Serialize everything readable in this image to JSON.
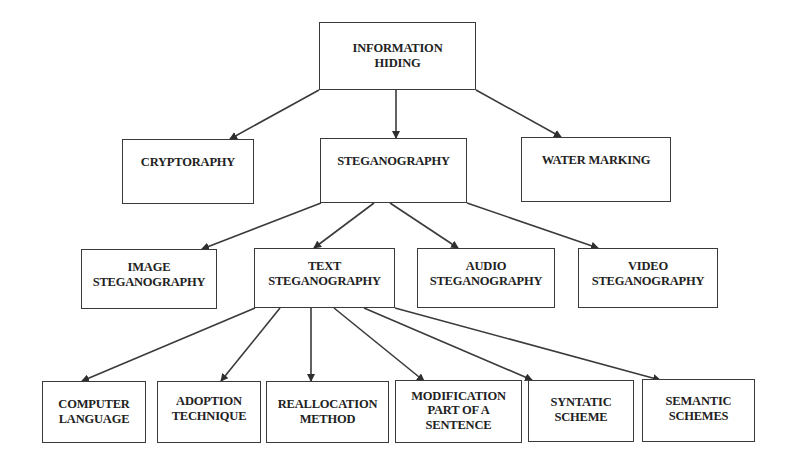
{
  "diagram": {
    "type": "hierarchy",
    "root": {
      "id": "information-hiding",
      "lines": [
        "INFORMATION",
        "HIDING"
      ]
    },
    "level1": [
      {
        "id": "cryptography",
        "lines": [
          "CRYPTORAPHY"
        ]
      },
      {
        "id": "steganography",
        "lines": [
          "STEGANOGRAPHY"
        ]
      },
      {
        "id": "water-marking",
        "lines": [
          "WATER MARKING"
        ]
      }
    ],
    "level2": [
      {
        "id": "image-steganography",
        "lines": [
          "IMAGE",
          "STEGANOGRAPHY"
        ]
      },
      {
        "id": "text-steganography",
        "lines": [
          "TEXT",
          "STEGANOGRAPHY"
        ]
      },
      {
        "id": "audio-steganography",
        "lines": [
          "AUDIO",
          "STEGANOGRAPHY"
        ]
      },
      {
        "id": "video-steganography",
        "lines": [
          "VIDEO",
          "STEGANOGRAPHY"
        ]
      }
    ],
    "level3": [
      {
        "id": "computer-language",
        "lines": [
          "COMPUTER",
          "LANGUAGE"
        ]
      },
      {
        "id": "adoption-technique",
        "lines": [
          "ADOPTION",
          "TECHNIQUE"
        ]
      },
      {
        "id": "reallocation-method",
        "lines": [
          "REALLOCATION",
          "METHOD"
        ]
      },
      {
        "id": "modification-part-of-a-sentence",
        "lines": [
          "MODIFICATION",
          "PART OF A",
          "SENTENCE"
        ]
      },
      {
        "id": "syntatic-scheme",
        "lines": [
          "SYNTATIC",
          "SCHEME"
        ]
      },
      {
        "id": "semantic-schemes",
        "lines": [
          "SEMANTIC",
          "SCHEMES"
        ]
      }
    ],
    "edges": [
      [
        "information-hiding",
        "cryptography"
      ],
      [
        "information-hiding",
        "steganography"
      ],
      [
        "information-hiding",
        "water-marking"
      ],
      [
        "steganography",
        "image-steganography"
      ],
      [
        "steganography",
        "text-steganography"
      ],
      [
        "steganography",
        "audio-steganography"
      ],
      [
        "steganography",
        "video-steganography"
      ],
      [
        "text-steganography",
        "computer-language"
      ],
      [
        "text-steganography",
        "adoption-technique"
      ],
      [
        "text-steganography",
        "reallocation-method"
      ],
      [
        "text-steganography",
        "modification-part-of-a-sentence"
      ],
      [
        "text-steganography",
        "syntatic-scheme"
      ],
      [
        "text-steganography",
        "semantic-schemes"
      ]
    ],
    "colors": {
      "line": "#3a3a3a",
      "text": "#222222",
      "background": "#ffffff"
    }
  }
}
